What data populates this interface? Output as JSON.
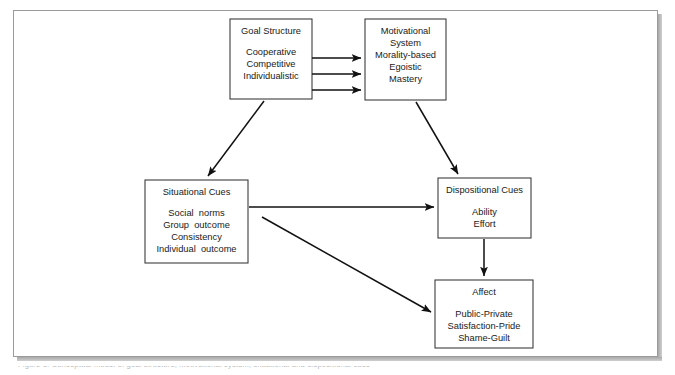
{
  "figure": {
    "kind": "flow-diagram",
    "background_color": "#ffffff",
    "frame_color": "#9a9a9a",
    "box_border_color": "#3d3d3d",
    "arrow_color": "#111111",
    "text_color": "#1a1a1a"
  },
  "nodes": {
    "goal_structure": {
      "title": "Goal Structure",
      "items": [
        "Cooperative",
        "Competitive",
        "Individualistic"
      ]
    },
    "motivational_system": {
      "title": "Motivational",
      "title_line2": "System",
      "items": [
        "Morality-based",
        "Egoistic",
        "Mastery"
      ]
    },
    "situational_cues": {
      "title": "Situational Cues",
      "items": [
        "Social  norms",
        "Group  outcome",
        "Consistency",
        "Individual  outcome"
      ]
    },
    "dispositional_cues": {
      "title": "Dispositional Cues",
      "items": [
        "Ability",
        "Effort"
      ]
    },
    "affect": {
      "title": "Affect",
      "items": [
        "Public-Private",
        "Satisfaction-Pride",
        "Shame-Guilt"
      ]
    }
  },
  "edges": [
    {
      "name": "goal-structure-to-motivational-1",
      "from": "goal_structure",
      "to": "motivational_system",
      "style": "horizontal-arrow"
    },
    {
      "name": "goal-structure-to-motivational-2",
      "from": "goal_structure",
      "to": "motivational_system",
      "style": "horizontal-arrow"
    },
    {
      "name": "goal-structure-to-motivational-3",
      "from": "goal_structure",
      "to": "motivational_system",
      "style": "horizontal-arrow"
    },
    {
      "name": "goal-structure-to-situational-cues",
      "from": "goal_structure",
      "to": "situational_cues",
      "style": "diagonal-arrow"
    },
    {
      "name": "motivational-to-dispositional-cues",
      "from": "motivational_system",
      "to": "dispositional_cues",
      "style": "diagonal-arrow"
    },
    {
      "name": "situational-to-dispositional-cues",
      "from": "situational_cues",
      "to": "dispositional_cues",
      "style": "horizontal-arrow"
    },
    {
      "name": "situational-cues-to-affect",
      "from": "situational_cues",
      "to": "affect",
      "style": "diagonal-arrow"
    },
    {
      "name": "dispositional-cues-to-affect",
      "from": "dispositional_cues",
      "to": "affect",
      "style": "vertical-arrow"
    }
  ],
  "caption": {
    "clipped_text": "Figure 1.  Conceptual model of goal structure, motivational system, situational and dispositional cues"
  }
}
